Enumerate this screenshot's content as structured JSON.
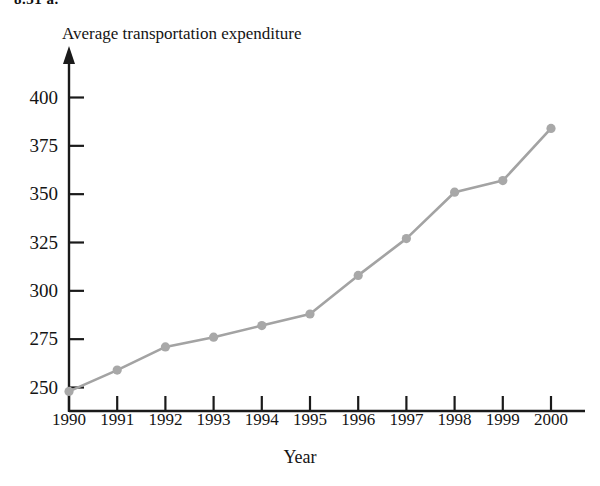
{
  "page": {
    "partial_header": "8.31 a."
  },
  "chart_data": {
    "type": "line",
    "title": "",
    "ylabel": "Average transportation expenditure",
    "xlabel": "Year",
    "categories": [
      "1990",
      "1991",
      "1992",
      "1993",
      "1994",
      "1995",
      "1996",
      "1997",
      "1998",
      "1999",
      "2000"
    ],
    "x": [
      1990,
      1991,
      1992,
      1993,
      1994,
      1995,
      1996,
      1997,
      1998,
      1999,
      2000
    ],
    "values": [
      248,
      259,
      271,
      276,
      282,
      288,
      308,
      327,
      351,
      357,
      384
    ],
    "series": [
      {
        "name": "Average transportation expenditure",
        "values": [
          248,
          259,
          271,
          276,
          282,
          288,
          308,
          327,
          351,
          357,
          384
        ]
      }
    ],
    "yticks": [
      250,
      275,
      300,
      325,
      350,
      375,
      400
    ],
    "ytick_labels": [
      "250",
      "275",
      "300",
      "325",
      "350",
      "375",
      "400"
    ],
    "xtick_labels": [
      "1990",
      "1991",
      "1992",
      "1993",
      "1994",
      "1995",
      "1996",
      "1997",
      "1998",
      "1999",
      "2000"
    ],
    "ylim": [
      240,
      410
    ],
    "xlim": [
      1989.6,
      2000.6
    ],
    "grid": false,
    "legend": false,
    "legend_position": "none",
    "line_color": "#a3a3a3",
    "marker_color": "#a8a8a8",
    "axis_color": "#1a1a1a",
    "marker": "circle",
    "annotations": []
  }
}
